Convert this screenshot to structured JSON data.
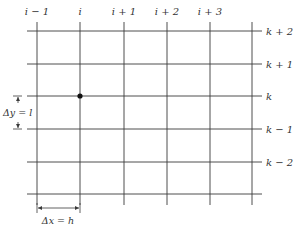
{
  "diagram": {
    "type": "finite-difference-grid",
    "column_labels": [
      "i − 1",
      "i",
      "i + 1",
      "i + 2",
      "i + 3"
    ],
    "row_labels": [
      "k + 2",
      "k + 1",
      "k",
      "k − 1",
      "k − 2"
    ],
    "dy_label": "Δy = l",
    "dx_label": "Δx = h",
    "highlighted_node": {
      "column": "i",
      "row": "k"
    },
    "colors": {
      "line": "#3a3a3a",
      "text": "#333333",
      "node": "#111111"
    }
  }
}
